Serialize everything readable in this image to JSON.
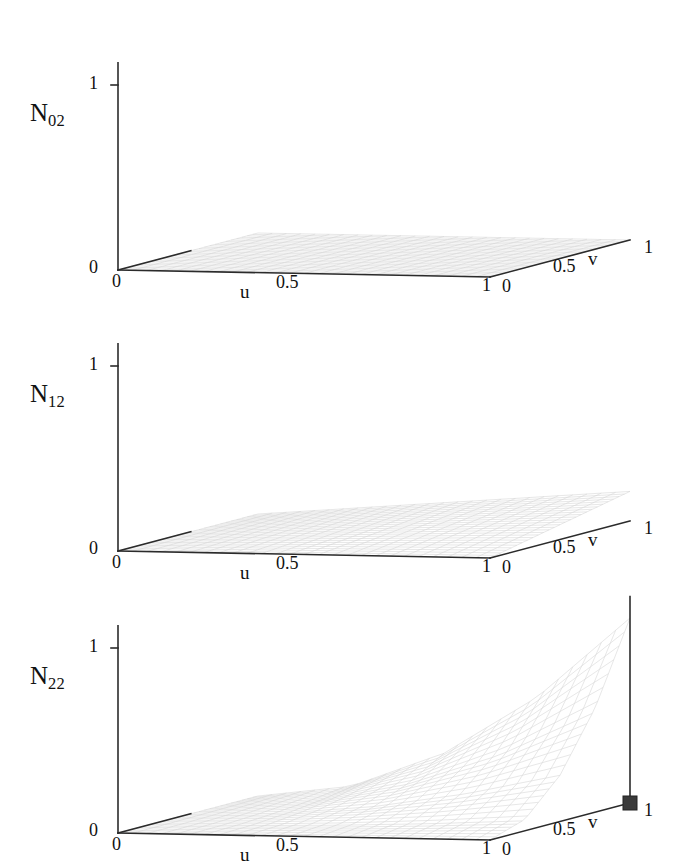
{
  "figure": {
    "type": "multi-panel-3d-surface-figure",
    "background_color": "#ffffff",
    "line_color": "#2b2b2b",
    "mesh_color": "#c9c9c9",
    "marker_color": "#3a3a3a",
    "panel_count": 3
  },
  "panels": [
    {
      "id": "panel-N02",
      "series_label_base": "N",
      "series_label_sub": "02",
      "z_ticks": [
        "0",
        "1"
      ],
      "u_axis": {
        "name": "u",
        "ticks": [
          "0",
          "0.5",
          "1"
        ]
      },
      "v_axis": {
        "name": "v",
        "ticks": [
          "0",
          "0.5",
          "1"
        ]
      },
      "marker": null
    },
    {
      "id": "panel-N12",
      "series_label_base": "N",
      "series_label_sub": "12",
      "z_ticks": [
        "0",
        "1"
      ],
      "u_axis": {
        "name": "u",
        "ticks": [
          "0",
          "0.5",
          "1"
        ]
      },
      "v_axis": {
        "name": "v",
        "ticks": [
          "0",
          "0.5",
          "1"
        ]
      },
      "marker": null
    },
    {
      "id": "panel-N22",
      "series_label_base": "N",
      "series_label_sub": "22",
      "z_ticks": [
        "0",
        "1"
      ],
      "u_axis": {
        "name": "u",
        "ticks": [
          "0",
          "0.5",
          "1"
        ]
      },
      "v_axis": {
        "name": "v",
        "ticks": [
          "0",
          "0.5",
          "1"
        ]
      },
      "marker": {
        "u": 1,
        "v": 1,
        "z": 1,
        "shape": "square"
      }
    }
  ],
  "chart_data": [
    {
      "type": "surface",
      "title": "N02",
      "xlabel": "u",
      "ylabel": "v",
      "zlabel": "N02",
      "xlim": [
        0,
        1
      ],
      "ylim": [
        0,
        1
      ],
      "zlim": [
        0,
        1
      ],
      "xticks": [
        0,
        0.5,
        1
      ],
      "yticks": [
        0,
        0.5,
        1
      ],
      "zticks": [
        0,
        1
      ],
      "grid": false,
      "legend": "none",
      "formula": "N02 = (1-u)^2 * (1-v)^2 style basis; peak near u=0,v=0",
      "u": [
        0,
        0.25,
        0.5,
        0.75,
        1
      ],
      "v": [
        0,
        0.25,
        0.5,
        0.75,
        1
      ],
      "z": [
        [
          0.0,
          0.0,
          0.0,
          0.0,
          0.0
        ],
        [
          0.0,
          0.0,
          0.0,
          0.0,
          0.0
        ],
        [
          0.0,
          0.0,
          0.0,
          0.0,
          0.0
        ],
        [
          0.0,
          0.0,
          0.0,
          0.0,
          0.0
        ],
        [
          0.0,
          0.0,
          0.0,
          0.0,
          0.0
        ]
      ],
      "note": "Surface is essentially flat at z=0 across the whole uv domain, with a faint mesh; no visible peak."
    },
    {
      "type": "surface",
      "title": "N12",
      "xlabel": "u",
      "ylabel": "v",
      "zlabel": "N12",
      "xlim": [
        0,
        1
      ],
      "ylim": [
        0,
        1
      ],
      "zlim": [
        0,
        1
      ],
      "xticks": [
        0,
        0.5,
        1
      ],
      "yticks": [
        0,
        0.5,
        1
      ],
      "zticks": [
        0,
        1
      ],
      "grid": false,
      "legend": "none",
      "u": [
        0,
        0.25,
        0.5,
        0.75,
        1
      ],
      "v": [
        0,
        0.25,
        0.5,
        0.75,
        1
      ],
      "z": [
        [
          0.0,
          0.0,
          0.0,
          0.0,
          0.0
        ],
        [
          0.0,
          0.01,
          0.02,
          0.03,
          0.04
        ],
        [
          0.0,
          0.02,
          0.04,
          0.06,
          0.08
        ],
        [
          0.0,
          0.03,
          0.06,
          0.09,
          0.12
        ],
        [
          0.0,
          0.04,
          0.08,
          0.12,
          0.16
        ]
      ],
      "note": "Low, gently rising surface; maximum height small (~0.15) at the far u=1,v=1 corner."
    },
    {
      "type": "surface",
      "title": "N22",
      "xlabel": "u",
      "ylabel": "v",
      "zlabel": "N22",
      "xlim": [
        0,
        1
      ],
      "ylim": [
        0,
        1
      ],
      "zlim": [
        0,
        1
      ],
      "xticks": [
        0,
        0.5,
        1
      ],
      "yticks": [
        0,
        0.5,
        1
      ],
      "zticks": [
        0,
        1
      ],
      "grid": false,
      "legend": "none",
      "annotations": [
        {
          "label": "square marker at peak",
          "u": 1,
          "v": 1,
          "z": 1
        }
      ],
      "u": [
        0,
        0.25,
        0.5,
        0.75,
        1
      ],
      "v": [
        0,
        0.25,
        0.5,
        0.75,
        1
      ],
      "z": [
        [
          0.0,
          0.0,
          0.0,
          0.0,
          0.0
        ],
        [
          0.0,
          0.004,
          0.016,
          0.035,
          0.062
        ],
        [
          0.0,
          0.016,
          0.062,
          0.141,
          0.25
        ],
        [
          0.0,
          0.035,
          0.141,
          0.316,
          0.562
        ],
        [
          0.0,
          0.062,
          0.25,
          0.562,
          1.0
        ]
      ],
      "note": "Surface N22 = u^2 * v^2 rising to 1.0 at the u=1, v=1 corner, where a filled square marker sits atop a vertical stem."
    }
  ]
}
